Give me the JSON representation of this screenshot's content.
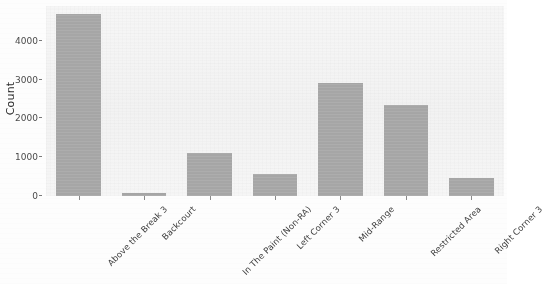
{
  "chart_data": {
    "type": "bar",
    "title": "",
    "xlabel": "",
    "ylabel": "Count",
    "categories": [
      "Above the Break 3",
      "Backcourt",
      "In The Paint (Non-RA)",
      "Left Corner 3",
      "Mid-Range",
      "Restricted Area",
      "Right Corner 3"
    ],
    "values": [
      4700,
      80,
      1120,
      570,
      2910,
      2360,
      470
    ],
    "ylim": [
      0,
      4900
    ],
    "yticks": [
      0,
      1000,
      2000,
      3000,
      4000
    ],
    "ytick_labels": [
      "0",
      "1000",
      "2000",
      "3000",
      "4000"
    ],
    "grid": false,
    "legend": "none",
    "bar_color": "#a9a9a9",
    "panel_color": "#f4f4f4",
    "axis_text_color": "#3d3d3d"
  },
  "axes": {
    "y_title": "Count"
  }
}
